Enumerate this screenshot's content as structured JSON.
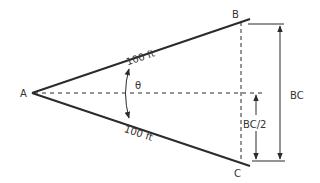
{
  "diagram": {
    "title": "",
    "colors": {
      "stroke": "#2b2b2b",
      "text": "#333333",
      "background": "#ffffff"
    },
    "points": {
      "A": {
        "label": "A"
      },
      "B": {
        "label": "B"
      },
      "C": {
        "label": "C"
      }
    },
    "sides": {
      "AB": {
        "label": "100 ft"
      },
      "AC": {
        "label": "100 ft"
      }
    },
    "angle": {
      "label": "θ"
    },
    "dimensions": {
      "BC": {
        "label": "BC"
      },
      "half_BC": {
        "label": "BC/2"
      }
    }
  }
}
